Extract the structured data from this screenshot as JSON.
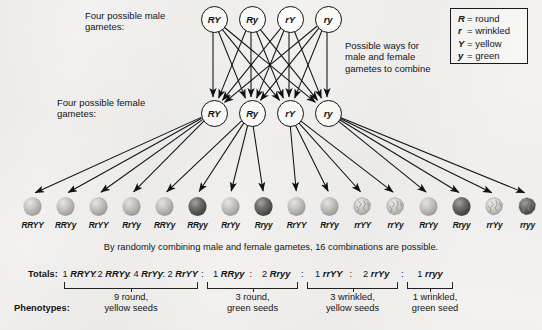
{
  "labels": {
    "male_gametes": "Four possible male\ngametes:",
    "female_gametes": "Four possible female\ngametes:",
    "combine_note": "Possible ways for\nmale and female\ngametes to combine",
    "caption": "By randomly combining male and female gametes, 16 combinations are possible.",
    "totals_label": "Totals:",
    "phenotypes_label": "Phenotypes:"
  },
  "legend": {
    "items": [
      {
        "allele": "R",
        "meaning": "= round"
      },
      {
        "allele": "r",
        "meaning": "= wrinkled"
      },
      {
        "allele": "Y",
        "meaning": "= yellow"
      },
      {
        "allele": "y",
        "meaning": "= green"
      }
    ]
  },
  "male_gametes": [
    {
      "label": "RY"
    },
    {
      "label": "Ry"
    },
    {
      "label": "rY"
    },
    {
      "label": "ry"
    }
  ],
  "female_gametes": [
    {
      "label": "RY"
    },
    {
      "label": "Ry"
    },
    {
      "label": "rY"
    },
    {
      "label": "ry"
    }
  ],
  "offspring": [
    {
      "genotype": "RRYY",
      "shape": "round",
      "color": "yellow"
    },
    {
      "genotype": "RRYy",
      "shape": "round",
      "color": "yellow"
    },
    {
      "genotype": "RrYY",
      "shape": "round",
      "color": "yellow"
    },
    {
      "genotype": "RrYy",
      "shape": "round",
      "color": "yellow"
    },
    {
      "genotype": "RRYy",
      "shape": "round",
      "color": "yellow"
    },
    {
      "genotype": "RRyy",
      "shape": "round",
      "color": "green"
    },
    {
      "genotype": "RrYy",
      "shape": "round",
      "color": "yellow"
    },
    {
      "genotype": "Rryy",
      "shape": "round",
      "color": "green"
    },
    {
      "genotype": "RrYY",
      "shape": "round",
      "color": "yellow"
    },
    {
      "genotype": "RrYy",
      "shape": "round",
      "color": "yellow"
    },
    {
      "genotype": "rrYY",
      "shape": "wrinkled",
      "color": "yellow"
    },
    {
      "genotype": "rrYy",
      "shape": "wrinkled",
      "color": "yellow"
    },
    {
      "genotype": "RrYy",
      "shape": "round",
      "color": "yellow"
    },
    {
      "genotype": "Rryy",
      "shape": "round",
      "color": "green"
    },
    {
      "genotype": "rrYy",
      "shape": "wrinkled",
      "color": "yellow"
    },
    {
      "genotype": "rryy",
      "shape": "wrinkled",
      "color": "green"
    }
  ],
  "totals": {
    "groups": [
      {
        "terms": [
          "1 RRYY",
          "2 RRYy",
          "4 RrYy",
          "2 RrYY"
        ],
        "count_line": "9 round,",
        "phenotype": "9 round,\nyellow seeds"
      },
      {
        "terms": [
          "1 RRyy",
          "2 Rryy"
        ],
        "count_line": "3 round,",
        "phenotype": "3 round,\ngreen seeds"
      },
      {
        "terms": [
          "1 rrYY",
          "2 rrYy"
        ],
        "count_line": "3 wrinkled,",
        "phenotype": "3 wrinkled,\nyellow seeds"
      },
      {
        "terms": [
          "1 rryy"
        ],
        "count_line": "1 wrinkled,",
        "phenotype": "1 wrinkled,\ngreen seed"
      }
    ],
    "separator": ":"
  },
  "colors": {
    "background": "#f2f1ef",
    "ink": "#141414",
    "seed_yellow": "#b9b9b7",
    "seed_green": "#646463",
    "seed_wrinkled": "#c2c1bd"
  }
}
